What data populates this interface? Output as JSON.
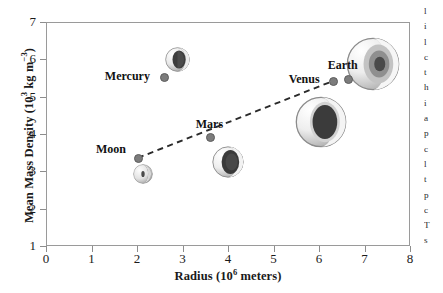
{
  "chart_data": {
    "type": "scatter",
    "title": "",
    "xlabel": "Radius (10^6 meters)",
    "xlabel_main": "Radius (10",
    "xlabel_exp": "6",
    "xlabel_tail": " meters)",
    "ylabel": "Mean Mass Density (10^3 kg m^-3)",
    "ylabel_a": "Mean Mass Density (10",
    "ylabel_exp1": "3",
    "ylabel_b": " kg m",
    "ylabel_exp2": "−3",
    "ylabel_c": ")",
    "xlim": [
      0,
      8
    ],
    "ylim": [
      1,
      7
    ],
    "xticks": [
      "0",
      "1",
      "2",
      "3",
      "4",
      "5",
      "6",
      "7",
      "8"
    ],
    "yticks": [
      "1",
      "2",
      "3",
      "4",
      "5",
      "6",
      "7"
    ],
    "grid": false,
    "legend": "none",
    "points": [
      {
        "name": "Moon",
        "x": 2.02,
        "y": 3.36,
        "label": "Moon"
      },
      {
        "name": "Mercury",
        "x": 2.59,
        "y": 5.53,
        "label": "Mercury"
      },
      {
        "name": "Mars",
        "x": 3.6,
        "y": 3.92,
        "label": "Mars"
      },
      {
        "name": "Venus",
        "x": 6.3,
        "y": 5.42,
        "label": "Venus"
      },
      {
        "name": "Earth",
        "x": 6.63,
        "y": 5.5,
        "label": "Earth"
      }
    ],
    "trendline": {
      "style": "dashed",
      "x": [
        2.02,
        6.35
      ],
      "y": [
        3.36,
        5.44
      ]
    },
    "annotations": [
      {
        "name": "moon-sphere",
        "type": "cutaway-sphere",
        "x": 2.13,
        "y": 2.92
      },
      {
        "name": "mercury-sphere",
        "type": "cutaway-sphere",
        "x": 2.88,
        "y": 6.0
      },
      {
        "name": "mars-sphere",
        "type": "cutaway-sphere",
        "x": 4.0,
        "y": 3.25
      },
      {
        "name": "venus-sphere",
        "type": "cutaway-sphere",
        "x": 6.05,
        "y": 4.32
      },
      {
        "name": "earth-sphere",
        "type": "cutaway-sphere",
        "x": 7.18,
        "y": 5.88
      }
    ]
  },
  "colors": {
    "frame": "#9a9a9a",
    "point": "#7c7c7c",
    "trendline": "#2a2a2a",
    "text": "#1a1a1a",
    "background": "#ffffff"
  },
  "text_column": {
    "lines": [
      "l",
      "i",
      "l",
      "c",
      "t",
      "h",
      "i",
      "a",
      "p",
      "c",
      "l",
      "t",
      "p",
      "c",
      "T",
      "s"
    ]
  }
}
